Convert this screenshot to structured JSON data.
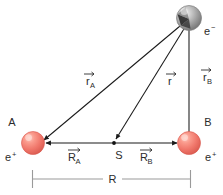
{
  "figure": {
    "background_color": "#ffffff",
    "line_color": "#1a1a1a",
    "dimension_color": "#9a9a9a",
    "text_color": "#2b2b2b",
    "electron_color": "#8c8c8c",
    "positron_color": "#f0776b"
  },
  "particles": {
    "electron": {
      "point_label": "",
      "charge_label": "e",
      "charge_sign": "−",
      "color": "#8c8c8c"
    },
    "positron_a": {
      "point_label": "A",
      "charge_label": "e",
      "charge_sign": "+",
      "color": "#f0776b"
    },
    "positron_b": {
      "point_label": "B",
      "charge_label": "e",
      "charge_sign": "+",
      "color": "#f0776b"
    },
    "midpoint": {
      "point_label": "S"
    }
  },
  "vectors": {
    "r_a": {
      "symbol": "r",
      "subscript": "A"
    },
    "r": {
      "symbol": "r",
      "subscript": ""
    },
    "r_b": {
      "symbol": "r",
      "subscript": "B"
    },
    "R_a": {
      "symbol": "R",
      "subscript": "A"
    },
    "R_b": {
      "symbol": "R",
      "subscript": "B"
    }
  },
  "dimension": {
    "label": "R"
  }
}
